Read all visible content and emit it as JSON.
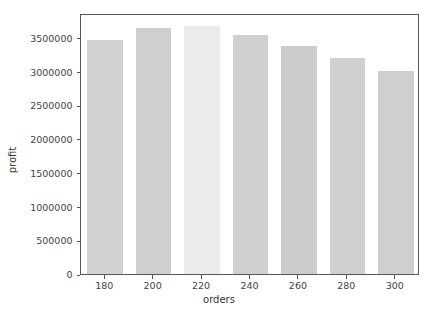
{
  "chart_data": {
    "type": "bar",
    "title": "",
    "xlabel": "orders",
    "ylabel": "profit",
    "categories": [
      "180",
      "200",
      "220",
      "240",
      "260",
      "280",
      "300"
    ],
    "values": [
      3460000,
      3640000,
      3670000,
      3540000,
      3380000,
      3200000,
      3000000
    ],
    "series": [
      {
        "name": "profit",
        "values": [
          3460000,
          3640000,
          3670000,
          3540000,
          3380000,
          3200000,
          3000000
        ]
      }
    ],
    "bar_colors": [
      "#d2d2d2",
      "#cfcfcf",
      "#ececec",
      "#d0d0d0",
      "#cccccc",
      "#d0d0d0",
      "#cfcfcf"
    ],
    "highlighted_category": "220",
    "ylim": [
      0,
      3866000
    ],
    "xlim": [
      170,
      310
    ],
    "ytick_labels": [
      "0",
      "500000",
      "1000000",
      "1500000",
      "2000000",
      "2500000",
      "3000000",
      "3500000"
    ],
    "ytick_values": [
      0,
      500000,
      1000000,
      1500000,
      2000000,
      2500000,
      3000000,
      3500000
    ],
    "xtick_labels": [
      "180",
      "200",
      "220",
      "240",
      "260",
      "280",
      "300"
    ],
    "xtick_values": [
      180,
      200,
      220,
      240,
      260,
      280,
      300
    ],
    "grid": false,
    "legend": null,
    "legend_position": "none",
    "frame_color": "#555555",
    "background": "#ffffff"
  },
  "axes": {
    "x_title": "orders",
    "y_title": "profit"
  }
}
